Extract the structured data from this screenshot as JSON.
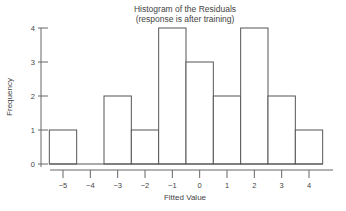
{
  "chart_data": {
    "type": "bar",
    "title": "Histogram of the Residuals",
    "subtitle": "(response is after training)",
    "xlabel": "Fitted Value",
    "ylabel": "Frequency",
    "categories": [
      "-5",
      "-4",
      "-3",
      "-2",
      "-1",
      "0",
      "1",
      "2",
      "3",
      "4"
    ],
    "values": [
      1,
      0,
      2,
      1,
      4,
      3,
      2,
      4,
      2,
      1
    ],
    "x_ticks": [
      "−5",
      "−4",
      "−3",
      "−2",
      "−1",
      "0",
      "1",
      "2",
      "3",
      "4"
    ],
    "y_ticks": [
      "0",
      "1",
      "2",
      "3",
      "4"
    ],
    "ylim": [
      0,
      4
    ],
    "xlim": [
      -5.5,
      4.5
    ],
    "grid": false,
    "legend": null,
    "bar_fill": "#ffffff",
    "bar_stroke": "#555555"
  }
}
